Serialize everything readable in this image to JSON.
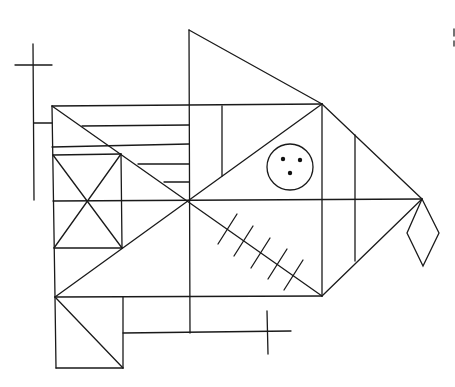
{
  "figure": {
    "stroke_color": "#1a1a1a",
    "background": "#ffffff",
    "elements": [
      "main-rectangle",
      "center-vertical",
      "middle-horizontal",
      "main-diagonals",
      "top-triangle",
      "right-triangle",
      "left-cross",
      "small-square-with-x",
      "horizontal-lines-upper-left",
      "circle-with-three-dots",
      "diagonal-with-five-ticks",
      "bottom-left-square-with-diagonal",
      "bottom-cross",
      "diamond",
      "vertical-in-upper-rectangle",
      "vertical-in-right-triangle"
    ]
  }
}
